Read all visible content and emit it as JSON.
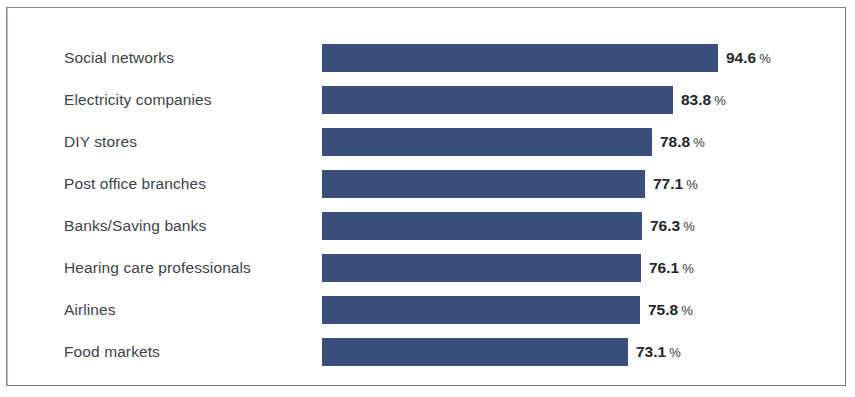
{
  "chart_data": {
    "type": "bar",
    "orientation": "horizontal",
    "title": "",
    "subtitle": "",
    "xlabel": "",
    "ylabel": "",
    "grid": false,
    "legend": null,
    "value_suffix": "%",
    "xlim": [
      0,
      100
    ],
    "categories": [
      "Social networks",
      "Electricity companies",
      "DIY stores",
      "Post office branches",
      "Banks/Saving banks",
      "Hearing care professionals",
      "Airlines",
      "Food markets"
    ],
    "values": [
      94.6,
      83.8,
      78.8,
      77.1,
      76.3,
      76.1,
      75.8,
      73.1
    ],
    "value_labels": [
      "94.6",
      "83.8",
      "78.8",
      "77.1",
      "76.3",
      "76.1",
      "75.8",
      "73.1"
    ],
    "colors": {
      "bar": "#3b4f7d",
      "label_text": "#3f4348",
      "value_text": "#24262a",
      "background": "#ffffff",
      "border": "#6f7780"
    }
  }
}
